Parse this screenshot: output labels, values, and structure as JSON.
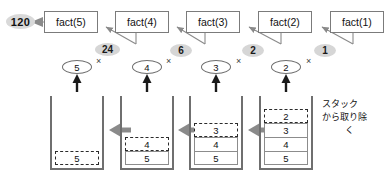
{
  "diagram": {
    "result": {
      "label": "120"
    },
    "calls": [
      {
        "label": "fact(5)"
      },
      {
        "label": "fact(4)"
      },
      {
        "label": "fact(3)"
      },
      {
        "label": "fact(2)"
      },
      {
        "label": "fact(1)"
      }
    ],
    "return_values": [
      {
        "label": "24"
      },
      {
        "label": "6"
      },
      {
        "label": "2"
      },
      {
        "label": "1"
      }
    ],
    "multipliers": [
      {
        "label": "5"
      },
      {
        "label": "4"
      },
      {
        "label": "3"
      },
      {
        "label": "2"
      }
    ],
    "times_symbol": "×",
    "stacks": [
      {
        "name": "stack-step-4",
        "cells": [
          {
            "value": "5",
            "style": "dashed"
          }
        ]
      },
      {
        "name": "stack-step-3",
        "cells": [
          {
            "value": "4",
            "style": "dashed"
          },
          {
            "value": "5",
            "style": "solid"
          }
        ]
      },
      {
        "name": "stack-step-2",
        "cells": [
          {
            "value": "3",
            "style": "dashed"
          },
          {
            "value": "4",
            "style": "solid"
          },
          {
            "value": "5",
            "style": "solid"
          }
        ]
      },
      {
        "name": "stack-step-1",
        "cells": [
          {
            "value": "2",
            "style": "dashed"
          },
          {
            "value": "3",
            "style": "solid"
          },
          {
            "value": "4",
            "style": "solid"
          },
          {
            "value": "5",
            "style": "solid"
          }
        ]
      }
    ],
    "annotation": {
      "line1": "スタック",
      "line2": "から取り除",
      "line3": "く"
    },
    "colors": {
      "box_border": "#7b7b7b",
      "pill_fill": "#d6d6d6",
      "stack_border": "#6f6f6f",
      "arrow_gray": "#8a8a8a",
      "arrow_black": "#1a1a1a",
      "text": "#111111"
    }
  }
}
